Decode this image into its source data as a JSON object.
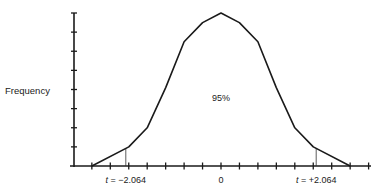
{
  "chart_data": {
    "type": "line",
    "title": "",
    "xlabel": "",
    "ylabel": "Frequency",
    "x_tick_step": 0.4,
    "xlim": [
      -3.2,
      3.2
    ],
    "ylim": [
      0,
      8
    ],
    "y_tick_step": 1,
    "grid": false,
    "x_tick_labels": [
      {
        "x": -2.064,
        "label": "t = −2.064"
      },
      {
        "x": 0,
        "label": "0"
      },
      {
        "x": 2.064,
        "label": "t = +2.064"
      }
    ],
    "series": [
      {
        "name": "t-distribution",
        "x": [
          -2.8,
          -2.0,
          -1.6,
          -1.2,
          -0.8,
          -0.4,
          0,
          0.4,
          0.8,
          1.2,
          1.6,
          2.0,
          2.8
        ],
        "y": [
          0,
          1,
          2,
          4.1,
          6.5,
          7.5,
          8,
          7.5,
          6.5,
          4.1,
          2,
          1,
          0
        ]
      }
    ],
    "critical_lines": [
      -2.064,
      2.064
    ],
    "annotations": [
      {
        "x": 0,
        "y": 3.4,
        "text": "95%"
      }
    ]
  }
}
